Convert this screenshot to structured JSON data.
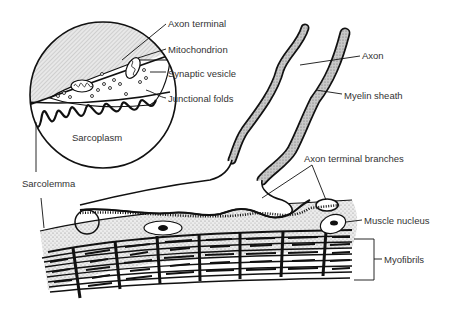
{
  "diagram": {
    "labels": {
      "axon_terminal": "Axon terminal",
      "mitochondrion": "Mitochondrion",
      "synaptic_vesicle": "Synaptic vesicle",
      "junctional_folds": "Junctional folds",
      "sarcoplasm": "Sarcoplasm",
      "sarcolemma": "Sarcolemma",
      "axon": "Axon",
      "myelin_sheath": "Myelin sheath",
      "axon_terminal_branches": "Axon terminal branches",
      "muscle_nucleus": "Muscle nucleus",
      "myofibrils": "Myofibrils"
    },
    "colors": {
      "line": "#111111",
      "stipple": "#d9d9d9",
      "myelin": "#bdbdbd",
      "label_text": "#333333",
      "background": "#ffffff"
    }
  }
}
